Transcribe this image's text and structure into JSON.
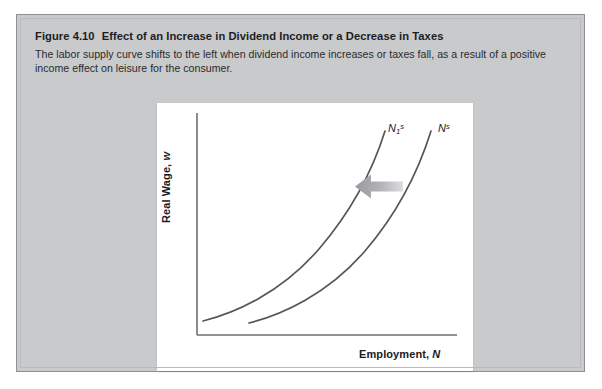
{
  "figure": {
    "number_label": "Figure 4.10",
    "title": "Effect of an Increase in Dividend Income or a Decrease in Taxes",
    "caption": "The labor supply curve shifts to the left when dividend income increases or taxes fall, as a result of a positive income effect on leisure for the consumer.",
    "colors": {
      "panel_background": "#c9cacb",
      "panel_border": "#8e9093",
      "chart_background": "#ffffff",
      "axis": "#6e6f72",
      "curve": "#55565a",
      "arrow": "#a9aaad",
      "text": "#1d1d1f"
    }
  },
  "chart_data": {
    "type": "line",
    "title": "Effect of an Increase in Dividend Income or a Decrease in Taxes",
    "xlabel": "Employment, N",
    "ylabel": "Real Wage, w",
    "xlabel_axis_variable": "N",
    "ylabel_axis_variable": "w",
    "grid": false,
    "legend": "inline-curve-labels",
    "axis_ticks": [],
    "xlim": [
      0,
      100
    ],
    "ylim": [
      0,
      100
    ],
    "annotations": [
      {
        "name": "leftward-shift-arrow",
        "type": "arrow",
        "direction": "left",
        "meaning": "labor supply curve shifts to the left",
        "from": [
          83,
          62
        ],
        "to": [
          63,
          62
        ]
      }
    ],
    "series": [
      {
        "name": "N_1^s",
        "label_text": "N",
        "label_sub": "1",
        "label_sup": "s",
        "description": "New labor supply curve after shift left",
        "label_position": [
          72,
          94
        ],
        "x": [
          3,
          10,
          20,
          31,
          41,
          50,
          57,
          62,
          66,
          69
        ],
        "y": [
          4,
          9,
          17,
          27,
          39,
          52,
          64,
          75,
          85,
          94
        ]
      },
      {
        "name": "N^s",
        "label_text": "N",
        "label_sub": "",
        "label_sup": "s",
        "description": "Original labor supply curve",
        "label_position": [
          89,
          94
        ],
        "x": [
          18,
          25,
          35,
          46,
          56,
          66,
          73,
          79,
          83,
          86
        ],
        "y": [
          3,
          8,
          16,
          26,
          38,
          51,
          63,
          74,
          84,
          93
        ]
      }
    ]
  },
  "svg_geometry": {
    "axis_origin": [
      40,
      232
    ],
    "axis_x_end": [
      300,
      232
    ],
    "axis_y_top": [
      40,
      10
    ],
    "curve_left_path": "M 46 218 C 78 210, 122 190, 160 148 C 196 108, 218 62, 228 30",
    "curve_right_path": "M 90 220 C 122 212, 166 192, 204 150 C 240 110, 264 62, 276 30",
    "arrow_shaft": {
      "x": 208,
      "y": 78,
      "w": 38,
      "h": 10
    },
    "arrow_head": "M 198 83 L 216 70 L 216 96 Z"
  }
}
